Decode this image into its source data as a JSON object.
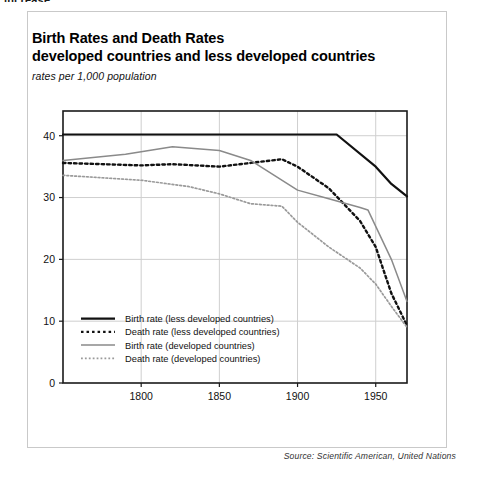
{
  "page": {
    "clipped_top_text": "increase."
  },
  "figure": {
    "title_line1": "Birth Rates and Death Rates",
    "title_line2": "developed countries and less developed countries",
    "subtitle": "rates per 1,000 population",
    "source": "Source: Scientific American, United Nations"
  },
  "colors": {
    "dark": "#111111",
    "gray": "#8a8a8a",
    "grid": "#cfcfcf",
    "frame": "#1a1a1a",
    "card_border": "#c9c9c9",
    "background": "#ffffff"
  },
  "chart_data": {
    "type": "line",
    "title": "Birth Rates and Death Rates developed countries and less developed countries",
    "subtitle": "rates per 1,000 population",
    "xlabel": "",
    "ylabel": "rates per 1,000 population",
    "xlim": [
      1750,
      1970
    ],
    "ylim": [
      0,
      44
    ],
    "xticks": [
      1800,
      1850,
      1900,
      1950
    ],
    "yticks": [
      0,
      10,
      20,
      30,
      40
    ],
    "xtick_labels": [
      "1800",
      "1850",
      "1900",
      "1950"
    ],
    "ytick_labels": [
      "0",
      "10",
      "20",
      "30",
      "40"
    ],
    "grid": true,
    "grid_axes": "both",
    "legend_position": "bottom-left-inside",
    "series": [
      {
        "name": "Birth rate (less developed countries)",
        "style": "solid",
        "color": "#111111",
        "width": 2.2,
        "x": [
          1750,
          1800,
          1850,
          1900,
          1925,
          1950,
          1960,
          1970
        ],
        "values": [
          40.2,
          40.2,
          40.2,
          40.2,
          40.2,
          35.0,
          32.2,
          30.2
        ]
      },
      {
        "name": "Death rate (less developed countries)",
        "style": "dotted",
        "color": "#111111",
        "width": 2.4,
        "x": [
          1750,
          1800,
          1820,
          1850,
          1870,
          1890,
          1900,
          1920,
          1940,
          1950,
          1960,
          1970
        ],
        "values": [
          35.6,
          35.2,
          35.4,
          35.0,
          35.6,
          36.2,
          35.0,
          31.5,
          26.2,
          22.0,
          14.5,
          9.3
        ]
      },
      {
        "name": "Birth rate (developed countries)",
        "style": "solid",
        "color": "#8a8a8a",
        "width": 1.5,
        "x": [
          1750,
          1790,
          1820,
          1850,
          1870,
          1900,
          1920,
          1940,
          1945,
          1960,
          1970
        ],
        "values": [
          36.0,
          37.0,
          38.2,
          37.6,
          36.0,
          31.2,
          29.8,
          28.4,
          28.0,
          20.0,
          13.2
        ]
      },
      {
        "name": "Death rate (developed countries)",
        "style": "dotted",
        "color": "#9a9a9a",
        "width": 1.7,
        "x": [
          1750,
          1800,
          1830,
          1850,
          1870,
          1890,
          1900,
          1920,
          1940,
          1950,
          1960,
          1970
        ],
        "values": [
          33.6,
          32.8,
          31.8,
          30.6,
          29.0,
          28.6,
          26.0,
          22.0,
          18.6,
          16.0,
          12.4,
          9.0
        ]
      }
    ],
    "legend_entries": [
      {
        "label": "Birth rate (less developed countries)",
        "style": "solid",
        "color": "#111111",
        "width": 2.2
      },
      {
        "label": "Death rate (less developed countries)",
        "style": "dotted",
        "color": "#111111",
        "width": 2.4
      },
      {
        "label": "Birth rate (developed countries)",
        "style": "solid",
        "color": "#8a8a8a",
        "width": 1.5
      },
      {
        "label": "Death rate (developed countries)",
        "style": "dotted",
        "color": "#9a9a9a",
        "width": 1.7
      }
    ]
  }
}
